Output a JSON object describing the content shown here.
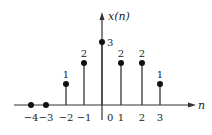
{
  "chart_data": {
    "type": "stem",
    "title": "",
    "ylabel": "x(n)",
    "xlabel": "n",
    "x": [
      -4,
      -3,
      -2,
      -1,
      0,
      1,
      2,
      3
    ],
    "values": [
      0,
      0,
      1,
      2,
      3,
      2,
      2,
      1
    ],
    "value_labels": [
      "",
      "",
      "1",
      "2",
      "3",
      "2",
      "2",
      "1"
    ],
    "tick_labels": [
      "−4",
      "−3",
      "−2",
      "−1",
      "0",
      "1",
      "2",
      "3"
    ],
    "xlim": [
      -5,
      4
    ],
    "ylim": [
      0,
      3.5
    ],
    "grid": false,
    "legend": null
  }
}
